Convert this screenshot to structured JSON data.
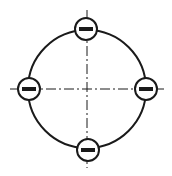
{
  "diagram": {
    "colors": {
      "stroke": "#1a1a1a",
      "background": "#ffffff"
    },
    "ring": {
      "cx": 87,
      "cy": 89,
      "r": 59
    },
    "axes": {
      "horizontal": {
        "x1": 10,
        "x2": 164,
        "y": 89
      },
      "vertical": {
        "x": 87,
        "y1": 10,
        "y2": 168
      }
    },
    "charges": [
      {
        "position": "top",
        "cx": 86,
        "cy": 29,
        "r": 11,
        "sign": "negative"
      },
      {
        "position": "left",
        "cx": 29,
        "cy": 89,
        "r": 11,
        "sign": "negative"
      },
      {
        "position": "right",
        "cx": 146,
        "cy": 89,
        "r": 11,
        "sign": "negative"
      },
      {
        "position": "bottom",
        "cx": 88,
        "cy": 150,
        "r": 11,
        "sign": "negative"
      }
    ]
  }
}
